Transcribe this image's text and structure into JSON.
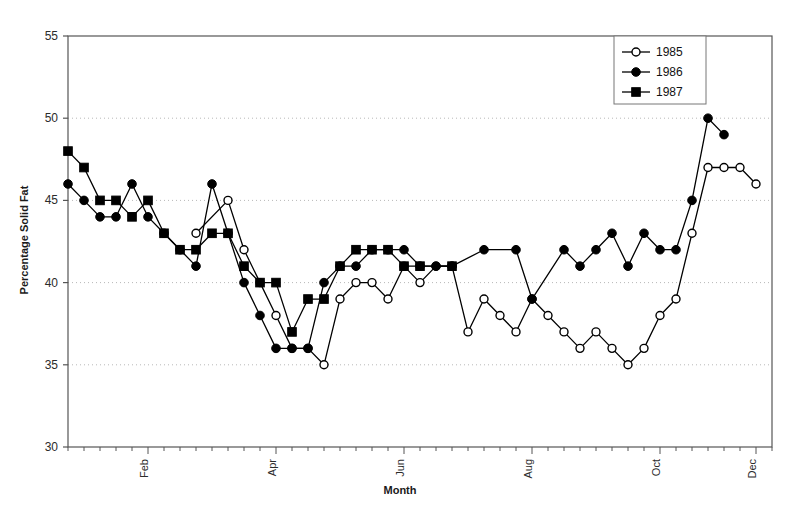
{
  "chart_data": {
    "type": "line",
    "title": "",
    "xlabel": "Month",
    "ylabel": "Percentage Solid Fat",
    "ylim": [
      30,
      55
    ],
    "yticks": [
      30,
      35,
      40,
      45,
      50,
      55
    ],
    "grid": true,
    "grid_style": "dotted-horizontal",
    "legend_position": "top-right",
    "x_tick_count": 45,
    "x_month_ticks": [
      {
        "label": "Feb",
        "index": 5
      },
      {
        "label": "Apr",
        "index": 13
      },
      {
        "label": "Jun",
        "index": 21
      },
      {
        "label": "Aug",
        "index": 29
      },
      {
        "label": "Oct",
        "index": 37
      },
      {
        "label": "Dec",
        "index": 43
      }
    ],
    "series": [
      {
        "name": "1985",
        "marker": "open-circle",
        "color": "#000000",
        "points": [
          {
            "x": 8,
            "y": 43
          },
          {
            "x": 10,
            "y": 45
          },
          {
            "x": 11,
            "y": 42
          },
          {
            "x": 12,
            "y": 40
          },
          {
            "x": 13,
            "y": 38
          },
          {
            "x": 14,
            "y": 36
          },
          {
            "x": 15,
            "y": 36
          },
          {
            "x": 16,
            "y": 35
          },
          {
            "x": 17,
            "y": 39
          },
          {
            "x": 18,
            "y": 40
          },
          {
            "x": 19,
            "y": 40
          },
          {
            "x": 20,
            "y": 39
          },
          {
            "x": 21,
            "y": 41
          },
          {
            "x": 22,
            "y": 40
          },
          {
            "x": 23,
            "y": 41
          },
          {
            "x": 24,
            "y": 41
          },
          {
            "x": 25,
            "y": 37
          },
          {
            "x": 26,
            "y": 39
          },
          {
            "x": 27,
            "y": 38
          },
          {
            "x": 28,
            "y": 37
          },
          {
            "x": 29,
            "y": 39
          },
          {
            "x": 30,
            "y": 38
          },
          {
            "x": 31,
            "y": 37
          },
          {
            "x": 32,
            "y": 36
          },
          {
            "x": 33,
            "y": 37
          },
          {
            "x": 34,
            "y": 36
          },
          {
            "x": 35,
            "y": 35
          },
          {
            "x": 36,
            "y": 36
          },
          {
            "x": 37,
            "y": 38
          },
          {
            "x": 38,
            "y": 39
          },
          {
            "x": 39,
            "y": 43
          },
          {
            "x": 40,
            "y": 47
          },
          {
            "x": 41,
            "y": 47
          },
          {
            "x": 42,
            "y": 47
          },
          {
            "x": 43,
            "y": 46
          }
        ]
      },
      {
        "name": "1986",
        "marker": "filled-circle",
        "color": "#000000",
        "points": [
          {
            "x": 0,
            "y": 46
          },
          {
            "x": 1,
            "y": 45
          },
          {
            "x": 2,
            "y": 44
          },
          {
            "x": 3,
            "y": 44
          },
          {
            "x": 4,
            "y": 46
          },
          {
            "x": 5,
            "y": 44
          },
          {
            "x": 6,
            "y": 43
          },
          {
            "x": 7,
            "y": 42
          },
          {
            "x": 8,
            "y": 41
          },
          {
            "x": 9,
            "y": 46
          },
          {
            "x": 10,
            "y": 43
          },
          {
            "x": 11,
            "y": 40
          },
          {
            "x": 12,
            "y": 38
          },
          {
            "x": 13,
            "y": 36
          },
          {
            "x": 14,
            "y": 36
          },
          {
            "x": 15,
            "y": 36
          },
          {
            "x": 16,
            "y": 40
          },
          {
            "x": 17,
            "y": 41
          },
          {
            "x": 18,
            "y": 41
          },
          {
            "x": 19,
            "y": 42
          },
          {
            "x": 20,
            "y": 42
          },
          {
            "x": 21,
            "y": 42
          },
          {
            "x": 22,
            "y": 41
          },
          {
            "x": 23,
            "y": 41
          },
          {
            "x": 24,
            "y": 41
          },
          {
            "x": 26,
            "y": 42
          },
          {
            "x": 28,
            "y": 42
          },
          {
            "x": 29,
            "y": 39
          },
          {
            "x": 31,
            "y": 42
          },
          {
            "x": 32,
            "y": 41
          },
          {
            "x": 33,
            "y": 42
          },
          {
            "x": 34,
            "y": 43
          },
          {
            "x": 35,
            "y": 41
          },
          {
            "x": 36,
            "y": 43
          },
          {
            "x": 37,
            "y": 42
          },
          {
            "x": 38,
            "y": 42
          },
          {
            "x": 39,
            "y": 45
          },
          {
            "x": 40,
            "y": 50
          },
          {
            "x": 41,
            "y": 49
          }
        ]
      },
      {
        "name": "1987",
        "marker": "filled-square",
        "color": "#000000",
        "points": [
          {
            "x": 0,
            "y": 48
          },
          {
            "x": 1,
            "y": 47
          },
          {
            "x": 2,
            "y": 45
          },
          {
            "x": 3,
            "y": 45
          },
          {
            "x": 4,
            "y": 44
          },
          {
            "x": 5,
            "y": 45
          },
          {
            "x": 6,
            "y": 43
          },
          {
            "x": 7,
            "y": 42
          },
          {
            "x": 8,
            "y": 42
          },
          {
            "x": 9,
            "y": 43
          },
          {
            "x": 10,
            "y": 43
          },
          {
            "x": 11,
            "y": 41
          },
          {
            "x": 12,
            "y": 40
          },
          {
            "x": 13,
            "y": 40
          },
          {
            "x": 14,
            "y": 37
          },
          {
            "x": 15,
            "y": 39
          },
          {
            "x": 16,
            "y": 39
          },
          {
            "x": 17,
            "y": 41
          },
          {
            "x": 18,
            "y": 42
          },
          {
            "x": 19,
            "y": 42
          },
          {
            "x": 20,
            "y": 42
          },
          {
            "x": 21,
            "y": 41
          },
          {
            "x": 22,
            "y": 41
          },
          {
            "x": 24,
            "y": 41
          }
        ]
      }
    ]
  },
  "legend": {
    "entries": [
      {
        "label": "1985",
        "marker": "open-circle"
      },
      {
        "label": "1986",
        "marker": "filled-circle"
      },
      {
        "label": "1987",
        "marker": "filled-square"
      }
    ]
  },
  "axes": {
    "y_title": "Percentage Solid Fat",
    "x_title": "Month",
    "y_tick_labels": [
      "30",
      "35",
      "40",
      "45",
      "50",
      "55"
    ],
    "x_tick_labels": [
      "Feb",
      "Apr",
      "Jun",
      "Aug",
      "Oct",
      "Dec"
    ]
  },
  "colors": {
    "line": "#000000",
    "grid": "#b8b8b8",
    "axis": "#555555",
    "background": "#ffffff"
  }
}
